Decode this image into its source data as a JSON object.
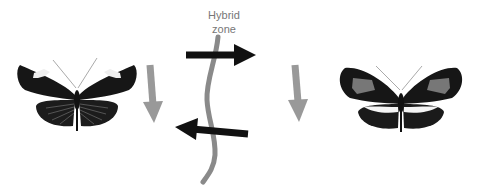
{
  "hybrid_zone": {
    "label_line1": "Hybrid",
    "label_line2": "zone",
    "line_color": "#8a8a8a"
  },
  "arrows": {
    "gene_flow_color": "#111111",
    "selection_color": "#999999",
    "items": [
      {
        "name": "gene-flow-right",
        "direction": "right"
      },
      {
        "name": "gene-flow-left",
        "direction": "left"
      },
      {
        "name": "selection-down-left",
        "direction": "down"
      },
      {
        "name": "selection-down-right",
        "direction": "down"
      }
    ]
  },
  "butterflies": [
    {
      "name": "left-butterfly",
      "pattern": "black wings with white forewing spots and striped hindwings"
    },
    {
      "name": "right-butterfly",
      "pattern": "black wings with gray forewing patches and white hindwing bar"
    }
  ]
}
